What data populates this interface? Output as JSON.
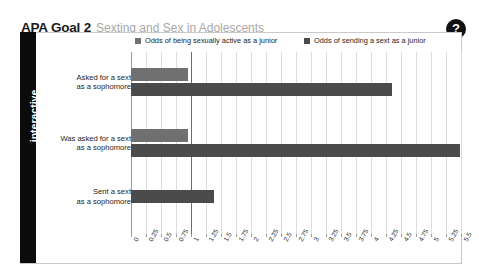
{
  "header": {
    "title_main": "APA Goal 2",
    "title_sub": "Sexting and Sex in Adolescents",
    "help_label": "?"
  },
  "sidebar": {
    "label": "interactive"
  },
  "chart_data": {
    "type": "bar",
    "orientation": "horizontal",
    "title": "",
    "subtitle": "",
    "xlabel": "",
    "ylabel": "",
    "xlim": [
      0,
      5.5
    ],
    "grid": true,
    "legend_position": "top",
    "categories": [
      "Asked for a sext as a sophomore",
      "Was asked for a sext as a sophomore",
      "Sent a sext as a sophomore"
    ],
    "category_lines": [
      [
        "Asked for a sext",
        "as a sophomore"
      ],
      [
        "Was asked for a sext",
        "as a sophomore"
      ],
      [
        "Sent a sext",
        "as a sophomore"
      ]
    ],
    "series": [
      {
        "name": "Odds of being sexually active as a junior",
        "color": "#707070",
        "values": [
          0.95,
          0.95,
          null
        ]
      },
      {
        "name": "Odds of sending a sext as a junior",
        "color": "#4b4b4b",
        "values": [
          4.35,
          5.48,
          1.38
        ]
      }
    ],
    "xticks": [
      "0",
      "0.25",
      "0.5",
      "0.75",
      "1",
      "1.25",
      "1.5",
      "1.75",
      "2",
      "2.25",
      "2.5",
      "2.75",
      "3",
      "3.25",
      "3.5",
      "3.75",
      "4",
      "4.25",
      "4.5",
      "4.75",
      "5",
      "5.25",
      "5.5"
    ],
    "xtick_values": [
      0,
      0.25,
      0.5,
      0.75,
      1,
      1.25,
      1.5,
      1.75,
      2,
      2.25,
      2.5,
      2.75,
      3,
      3.25,
      3.5,
      3.75,
      4,
      4.25,
      4.5,
      4.75,
      5,
      5.25,
      5.5
    ]
  },
  "colors": {
    "series_light": "#707070",
    "series_dark": "#4b4b4b",
    "sidebar": "#0b0b0b",
    "grid": "#dcdcdc",
    "title_sub": "#a8a8a8"
  }
}
